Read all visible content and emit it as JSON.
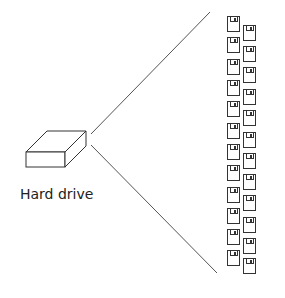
{
  "diagram": {
    "hard_drive": {
      "label": "Hard drive",
      "icon": "hard-drive-box-icon"
    },
    "floppy_disks": {
      "icon": "floppy-disk-icon",
      "count": 24,
      "left_column_tops": [
        16,
        37,
        59,
        80,
        101,
        123,
        144,
        165,
        187,
        208,
        229,
        250
      ],
      "right_column_tops": [
        25,
        46,
        67,
        89,
        110,
        132,
        153,
        174,
        195,
        217,
        238,
        258
      ]
    },
    "colors": {
      "line": "#555555",
      "stroke": "#333333",
      "background": "#ffffff"
    }
  }
}
